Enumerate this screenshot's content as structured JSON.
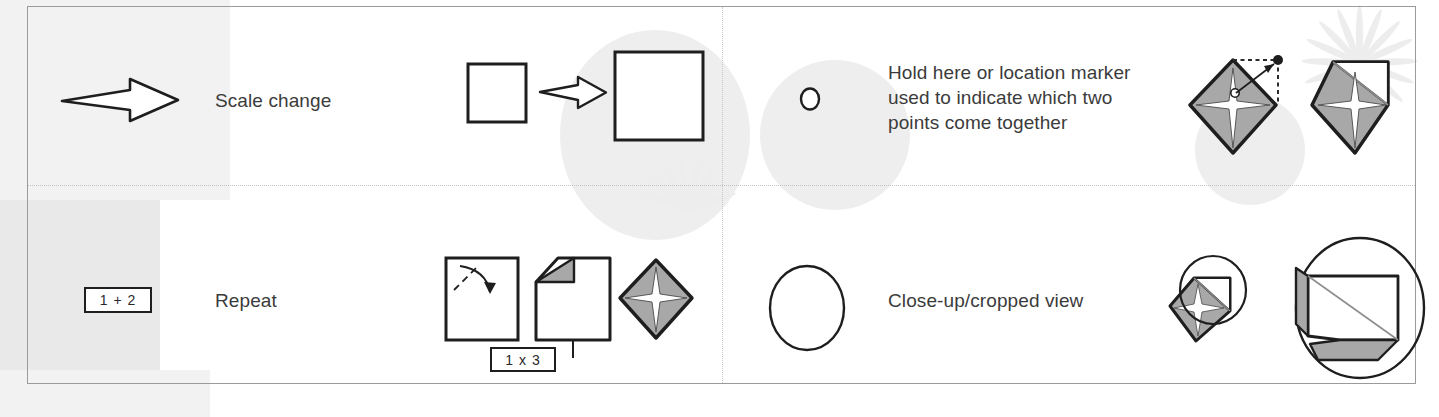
{
  "document": {
    "kind": "origami-symbols-legend",
    "columns": 2,
    "rows": 2
  },
  "colors": {
    "ink": "#1e1e1e",
    "text": "#3b3b3b",
    "paper_front": "#ffffff",
    "paper_back": "#a8a8a8",
    "paper_back_light": "#b5b5b5",
    "border": "#9b9b9b",
    "divider": "#c2c2c2",
    "watermark": "#eeeeee"
  },
  "rows": [
    {
      "id": "scale-change",
      "symbol": {
        "type": "hollow-arrow",
        "icon_name": "scale-change-arrow-icon"
      },
      "label": "Scale change",
      "example": {
        "icon_name": "scale-change-example-icon",
        "description": "small square, arrow, large square"
      }
    },
    {
      "id": "hold-here",
      "symbol": {
        "type": "circle-marker",
        "icon_name": "hold-here-circle-icon"
      },
      "label": "Hold here or location marker\nused to indicate which two\npoints come together",
      "example": {
        "icon_name": "hold-here-example-icon",
        "description": "diamond with star centre, dotted locator arrow, resulting diamond"
      }
    },
    {
      "id": "repeat",
      "symbol": {
        "type": "tag-box",
        "icon_name": "repeat-tag-icon",
        "text": "1 + 2"
      },
      "label": "Repeat",
      "example": {
        "icon_name": "repeat-example-icon",
        "description": "square with fold arrow, folded sheet with repeat tag, finished diamond",
        "tag_text": "1 x 3"
      }
    },
    {
      "id": "close-up",
      "symbol": {
        "type": "large-circle",
        "icon_name": "close-up-circle-icon"
      },
      "label": "Close-up/cropped view",
      "example": {
        "icon_name": "close-up-example-icon",
        "description": "small model with crop circle and magnified crop circle"
      }
    }
  ]
}
